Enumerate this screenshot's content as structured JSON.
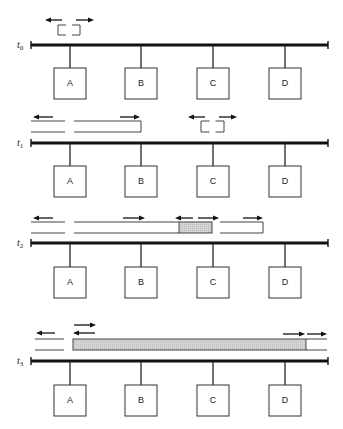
{
  "diagram": {
    "colors": {
      "bus": "#111111",
      "box_stroke": "#333333",
      "collision_fill": "#cfcfcf"
    },
    "bus": {
      "x_start": 31,
      "x_end": 328
    },
    "stations": [
      {
        "label": "A",
        "x": 70
      },
      {
        "label": "B",
        "x": 141
      },
      {
        "label": "C",
        "x": 213
      },
      {
        "label": "D",
        "x": 285
      }
    ],
    "rows": [
      {
        "time_label": "t",
        "time_sub": "0",
        "bus_y": 45,
        "box_top": 68,
        "brackets": [
          {
            "x1": 58,
            "x2": 80,
            "y1": 25,
            "y2": 35
          }
        ],
        "lines": [],
        "collisions": [],
        "arrows": [
          {
            "x1": 62,
            "x2": 45,
            "y": 20
          },
          {
            "x1": 76,
            "x2": 94,
            "y": 20
          }
        ]
      },
      {
        "time_label": "t",
        "time_sub": "1",
        "bus_y": 143,
        "box_top": 166,
        "brackets": [
          {
            "x1": 201,
            "x2": 224,
            "y1": 121,
            "y2": 132
          }
        ],
        "lines": [
          {
            "x1": 31,
            "x2": 65,
            "y": 121
          },
          {
            "x1": 31,
            "x2": 65,
            "y": 132
          },
          {
            "x1": 74,
            "x2": 141,
            "y": 121
          },
          {
            "x1": 74,
            "x2": 141,
            "y": 132
          },
          {
            "x1": 141,
            "x2": 141,
            "y1": 121,
            "y2": 132,
            "vertical": true
          }
        ],
        "collisions": [],
        "arrows": [
          {
            "x1": 53,
            "x2": 33,
            "y": 117
          },
          {
            "x1": 120,
            "x2": 140,
            "y": 117
          },
          {
            "x1": 205,
            "x2": 188,
            "y": 117
          },
          {
            "x1": 219,
            "x2": 237,
            "y": 117
          }
        ]
      },
      {
        "time_label": "t",
        "time_sub": "2",
        "bus_y": 243,
        "box_top": 267,
        "brackets": [],
        "lines": [
          {
            "x1": 31,
            "x2": 65,
            "y": 222
          },
          {
            "x1": 31,
            "x2": 65,
            "y": 233
          },
          {
            "x1": 74,
            "x2": 179,
            "y": 222
          },
          {
            "x1": 74,
            "x2": 179,
            "y": 233
          },
          {
            "x1": 220,
            "x2": 263,
            "y": 222
          },
          {
            "x1": 220,
            "x2": 263,
            "y": 233
          },
          {
            "x1": 263,
            "x2": 263,
            "y1": 222,
            "y2": 233,
            "vertical": true
          }
        ],
        "collisions": [
          {
            "x": 179,
            "y": 222,
            "w": 33,
            "h": 11
          }
        ],
        "arrows": [
          {
            "x1": 53,
            "x2": 33,
            "y": 218
          },
          {
            "x1": 123,
            "x2": 145,
            "y": 218
          },
          {
            "x1": 193,
            "x2": 175,
            "y": 218
          },
          {
            "x1": 198,
            "x2": 219,
            "y": 218
          },
          {
            "x1": 243,
            "x2": 263,
            "y": 218
          }
        ]
      },
      {
        "time_label": "t",
        "time_sub": "3",
        "bus_y": 361,
        "box_top": 385,
        "brackets": [],
        "lines": [
          {
            "x1": 35,
            "x2": 64,
            "y": 339
          },
          {
            "x1": 35,
            "x2": 64,
            "y": 350
          },
          {
            "x1": 306,
            "x2": 327,
            "y": 339
          },
          {
            "x1": 306,
            "x2": 327,
            "y": 350
          }
        ],
        "collisions": [
          {
            "x": 73,
            "y": 339,
            "w": 233,
            "h": 11
          }
        ],
        "arrows": [
          {
            "x1": 74,
            "x2": 96,
            "y": 325
          },
          {
            "x1": 95,
            "x2": 73,
            "y": 333
          },
          {
            "x1": 55,
            "x2": 36,
            "y": 333
          },
          {
            "x1": 283,
            "x2": 305,
            "y": 334
          },
          {
            "x1": 307,
            "x2": 327,
            "y": 334
          }
        ]
      }
    ]
  }
}
